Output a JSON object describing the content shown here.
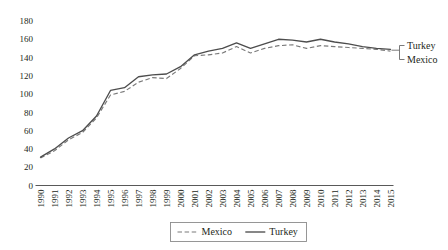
{
  "chart_data": {
    "type": "line",
    "title": "",
    "subtitle": "",
    "xlabel": "",
    "ylabel": "",
    "ylim": [
      0,
      180
    ],
    "ytick_step": 20,
    "yticks": [
      0,
      20,
      40,
      60,
      80,
      100,
      120,
      140,
      160,
      180
    ],
    "grid": false,
    "legend_position": "bottom-center",
    "categories": [
      "1990",
      "1991",
      "1992",
      "1993",
      "1994",
      "1995",
      "1996",
      "1997",
      "1998",
      "1999",
      "2000",
      "2001",
      "2002",
      "2003",
      "2004",
      "2005",
      "2006",
      "2007",
      "2008",
      "2009",
      "2010",
      "2011",
      "2012",
      "2013",
      "2014",
      "2015"
    ],
    "series": [
      {
        "name": "Mexico",
        "style": "dashed",
        "color": "#7a7a7a",
        "values": [
          30,
          38,
          50,
          58,
          74,
          99,
          103,
          113,
          118,
          117,
          128,
          142,
          143,
          145,
          152,
          145,
          150,
          153,
          154,
          150,
          153,
          152,
          151,
          150,
          149,
          147
        ]
      },
      {
        "name": "Turkey",
        "style": "solid",
        "color": "#4d4d4d",
        "values": [
          31,
          40,
          52,
          60,
          76,
          104,
          107,
          119,
          121,
          122,
          130,
          143,
          147,
          150,
          156,
          150,
          155,
          160,
          159,
          157,
          160,
          157,
          155,
          152,
          150,
          149
        ]
      }
    ],
    "annotations": [
      {
        "name": "turkey-end-label",
        "text": "Turkey",
        "series": "Turkey"
      },
      {
        "name": "mexico-end-label",
        "text": "Mexico",
        "series": "Mexico"
      }
    ],
    "legend": [
      {
        "label": "Mexico",
        "style": "dashed"
      },
      {
        "label": "Turkey",
        "style": "solid"
      }
    ]
  }
}
